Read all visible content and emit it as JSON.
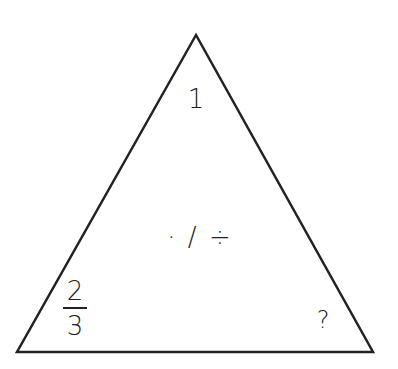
{
  "diagram": {
    "type": "fact-family-triangle",
    "stroke_color": "#222222",
    "background": "#ffffff",
    "triangle": {
      "apex": [
        196,
        35
      ],
      "base_left": [
        17,
        352
      ],
      "base_right": [
        373,
        352
      ]
    },
    "labels": {
      "top": "1",
      "center": "· / ÷",
      "bottom_left": {
        "numerator": "2",
        "denominator": "3"
      },
      "bottom_right": "?"
    }
  }
}
